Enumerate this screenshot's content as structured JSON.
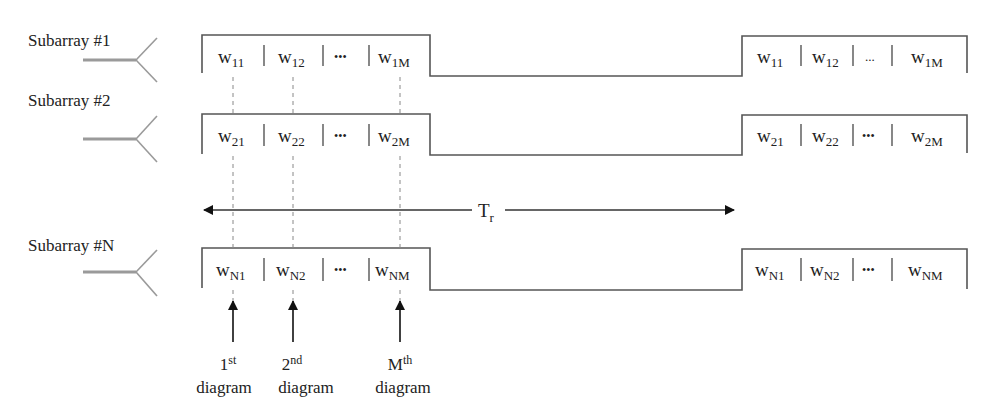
{
  "figure": {
    "rows": [
      {
        "label": "Subarray #1",
        "cells": [
          {
            "base": "w",
            "sub": "11"
          },
          {
            "base": "w",
            "sub": "12"
          },
          {
            "base": "•••",
            "sub": ""
          },
          {
            "base": "w",
            "sub": "1M"
          }
        ],
        "repeat_cells": [
          {
            "base": "w",
            "sub": "11"
          },
          {
            "base": "w",
            "sub": "12"
          },
          {
            "base": "...",
            "sub": ""
          },
          {
            "base": "w",
            "sub": "1M"
          }
        ]
      },
      {
        "label": "Subarray #2",
        "cells": [
          {
            "base": "w",
            "sub": "21"
          },
          {
            "base": "w",
            "sub": "22"
          },
          {
            "base": "•••",
            "sub": ""
          },
          {
            "base": "w",
            "sub": "2M"
          }
        ],
        "repeat_cells": [
          {
            "base": "w",
            "sub": "21"
          },
          {
            "base": "w",
            "sub": "22"
          },
          {
            "base": "•••",
            "sub": ""
          },
          {
            "base": "w",
            "sub": "2M"
          }
        ]
      },
      {
        "label": "Subarray #N",
        "cells": [
          {
            "base": "w",
            "sub": "N1"
          },
          {
            "base": "w",
            "sub": "N2"
          },
          {
            "base": "•••",
            "sub": ""
          },
          {
            "base": "w",
            "sub": "NM"
          }
        ],
        "repeat_cells": [
          {
            "base": "w",
            "sub": "N1"
          },
          {
            "base": "w",
            "sub": "N2"
          },
          {
            "base": "•••",
            "sub": ""
          },
          {
            "base": "w",
            "sub": "NM"
          }
        ]
      }
    ],
    "period": {
      "base": "T",
      "sub": "r"
    },
    "diagram_labels": [
      {
        "ordinal": "1",
        "suffix": "st",
        "word": "diagram"
      },
      {
        "ordinal": "2",
        "suffix": "nd",
        "word": "diagram"
      },
      {
        "ordinal": "M",
        "suffix": "th",
        "word": "diagram"
      }
    ],
    "colors": {
      "line": "#555555",
      "antenna": "#9a9a9a",
      "dashed": "#888888",
      "arrow": "#111111",
      "text": "#222222"
    }
  }
}
